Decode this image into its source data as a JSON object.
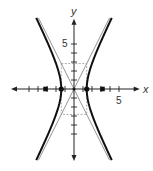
{
  "figure": {
    "axes": {
      "x_label": "x",
      "y_label": "y",
      "x_tick_label": "5",
      "y_tick_label": "5",
      "x_range": [
        -7,
        7.3
      ],
      "y_range": [
        -8,
        7.8
      ],
      "tick_min": -5,
      "tick_max": 5
    },
    "hyperbola": {
      "equation": "x^2/2 - y^2/8 = 1",
      "a_squared": 2,
      "b_squared": 8,
      "orientation": "horizontal",
      "y_extent": 7.9
    },
    "asymptotes": [
      "y = 2x",
      "y = -2x"
    ],
    "vertices": [
      [
        -1.414,
        0
      ],
      [
        1.414,
        0
      ]
    ],
    "foci": [
      [
        -3.162,
        0
      ],
      [
        3.162,
        0
      ]
    ],
    "fundamental_rectangle": {
      "x": [
        -1.414,
        1.414
      ],
      "y": [
        -2.828,
        2.828
      ]
    },
    "colors": {
      "curve": "#111111",
      "axis": "#222222",
      "asymptote": "#888888",
      "rectangle": "#999999",
      "point": "#111111"
    }
  }
}
